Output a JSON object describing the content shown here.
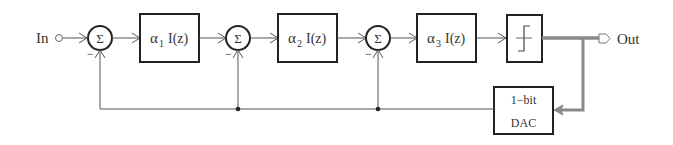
{
  "diagram": {
    "type": "block-diagram",
    "input_label": "In",
    "output_label": "Out",
    "summers": [
      {
        "id": "sum1",
        "symbol": "Σ",
        "minus_sign": "−"
      },
      {
        "id": "sum2",
        "symbol": "Σ",
        "minus_sign": "−"
      },
      {
        "id": "sum3",
        "symbol": "Σ",
        "minus_sign": "−"
      }
    ],
    "integrators": [
      {
        "id": "int1",
        "alpha": "α",
        "sub": "1",
        "func": "I(z)"
      },
      {
        "id": "int2",
        "alpha": "α",
        "sub": "2",
        "func": "I(z)"
      },
      {
        "id": "int3",
        "alpha": "α",
        "sub": "3",
        "func": "I(z)"
      }
    ],
    "quantizer": {
      "id": "quantizer",
      "label": "1-bit quantizer"
    },
    "dac": {
      "line1": "1−bit",
      "line2": "DAC"
    },
    "colors": {
      "line": "#555555",
      "box": "#222222",
      "thick_feedback": "#8a8a8a",
      "text": "#333333"
    }
  }
}
